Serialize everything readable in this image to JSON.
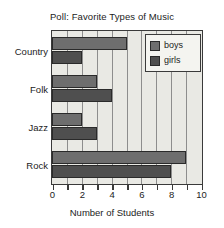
{
  "chart_data": {
    "type": "bar",
    "orientation": "horizontal",
    "title": "Poll: Favorite Types of Music",
    "xlabel": "Number of Students",
    "ylabel": "",
    "categories": [
      "Country",
      "Folk",
      "Jazz",
      "Rock"
    ],
    "series": [
      {
        "name": "boys",
        "values": [
          5,
          3,
          2,
          9
        ],
        "color": "#6e6e6e"
      },
      {
        "name": "girls",
        "values": [
          2,
          4,
          3,
          8
        ],
        "color": "#4f4f4f"
      }
    ],
    "xlim": [
      0,
      10
    ],
    "xticks": [
      0,
      1,
      2,
      3,
      4,
      5,
      6,
      7,
      8,
      9,
      10
    ],
    "xticklabels": [
      "0",
      "",
      "2",
      "",
      "4",
      "",
      "6",
      "",
      "8",
      "",
      "10"
    ],
    "grid": true,
    "grid_axis": "x",
    "legend_position": "top-right",
    "plot_background": "#e9e9e4",
    "frame_color": "#3a3a3a"
  }
}
